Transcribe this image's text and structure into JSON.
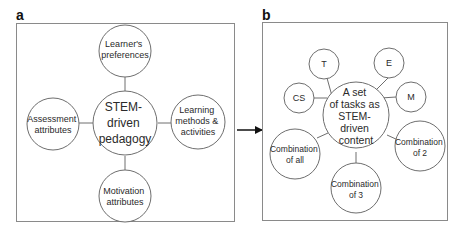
{
  "panels": {
    "a": {
      "letter": "a",
      "center": {
        "lines": [
          "STEM-",
          "driven",
          "pedagogy"
        ]
      },
      "nodes": {
        "top": {
          "lines": [
            "Learner's",
            "preferences"
          ]
        },
        "left": {
          "lines": [
            "Assessment",
            "attributes"
          ]
        },
        "right": {
          "lines": [
            "Learning",
            "methods &",
            "activities"
          ]
        },
        "bottom": {
          "lines": [
            "Motivation",
            "attributes"
          ]
        }
      }
    },
    "b": {
      "letter": "b",
      "center": {
        "lines": [
          "A set",
          "of tasks as",
          "STEM-",
          "driven",
          "content"
        ]
      },
      "nodes": {
        "t": {
          "lines": [
            "T"
          ]
        },
        "e": {
          "lines": [
            "E"
          ]
        },
        "cs": {
          "lines": [
            "CS"
          ]
        },
        "m": {
          "lines": [
            "M"
          ]
        },
        "comb_all": {
          "lines": [
            "Combination",
            "of all"
          ]
        },
        "comb_2": {
          "lines": [
            "Combination",
            "of 2"
          ]
        },
        "comb_3": {
          "lines": [
            "Combination",
            "of 3"
          ]
        }
      }
    }
  },
  "arrow": {
    "from": "a",
    "to": "b"
  }
}
